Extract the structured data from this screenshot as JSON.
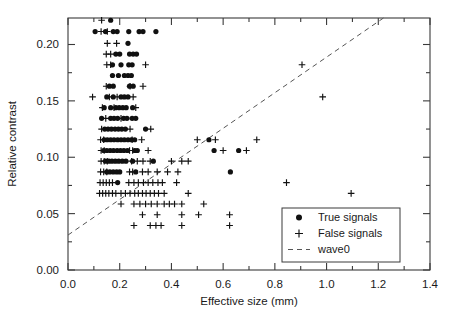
{
  "chart_data": {
    "type": "scatter",
    "title": "",
    "xlabel": "Effective size (mm)",
    "ylabel": "Relative contrast",
    "xlim": [
      0.0,
      1.4
    ],
    "ylim": [
      0.0,
      0.2235
    ],
    "grid": false,
    "legend_position": "lower-right",
    "xticks": [
      0.0,
      0.2,
      0.4,
      0.6,
      0.8,
      1.0,
      1.2,
      1.4
    ],
    "xticklabels": [
      "0.0",
      "0.2",
      "0.4",
      "0.6",
      "0.8",
      "1.0",
      "1.2",
      "1.4"
    ],
    "xminorticks": [
      0.1,
      0.3,
      0.5,
      0.7,
      0.9,
      1.1,
      1.3
    ],
    "yticks": [
      0.0,
      0.05,
      0.1,
      0.15,
      0.2
    ],
    "yticklabels": [
      "0.00",
      "0.05",
      "0.10",
      "0.15",
      "0.20"
    ],
    "yminorticks": [
      0.025,
      0.075,
      0.125,
      0.175
    ],
    "series": [
      {
        "name": "True signals",
        "marker": "filled-circle",
        "color": "#111111",
        "points": [
          [
            0.165,
            0.2215
          ],
          [
            0.105,
            0.2115
          ],
          [
            0.145,
            0.2115
          ],
          [
            0.175,
            0.2115
          ],
          [
            0.19,
            0.2115
          ],
          [
            0.235,
            0.2115
          ],
          [
            0.275,
            0.2115
          ],
          [
            0.29,
            0.2115
          ],
          [
            0.34,
            0.2115
          ],
          [
            0.232,
            0.201
          ],
          [
            0.185,
            0.1915
          ],
          [
            0.2,
            0.1915
          ],
          [
            0.238,
            0.1915
          ],
          [
            0.252,
            0.1915
          ],
          [
            0.265,
            0.1915
          ],
          [
            0.172,
            0.182
          ],
          [
            0.205,
            0.182
          ],
          [
            0.235,
            0.182
          ],
          [
            0.248,
            0.182
          ],
          [
            0.172,
            0.1725
          ],
          [
            0.195,
            0.1725
          ],
          [
            0.218,
            0.1725
          ],
          [
            0.232,
            0.1725
          ],
          [
            0.245,
            0.1725
          ],
          [
            0.16,
            0.163
          ],
          [
            0.175,
            0.163
          ],
          [
            0.238,
            0.163
          ],
          [
            0.252,
            0.163
          ],
          [
            0.15,
            0.1535
          ],
          [
            0.175,
            0.1535
          ],
          [
            0.205,
            0.1535
          ],
          [
            0.218,
            0.1535
          ],
          [
            0.232,
            0.1535
          ],
          [
            0.14,
            0.144
          ],
          [
            0.165,
            0.144
          ],
          [
            0.185,
            0.144
          ],
          [
            0.198,
            0.144
          ],
          [
            0.212,
            0.144
          ],
          [
            0.225,
            0.144
          ],
          [
            0.25,
            0.144
          ],
          [
            0.13,
            0.1345
          ],
          [
            0.165,
            0.1345
          ],
          [
            0.178,
            0.1345
          ],
          [
            0.192,
            0.1345
          ],
          [
            0.215,
            0.1345
          ],
          [
            0.228,
            0.1345
          ],
          [
            0.248,
            0.1345
          ],
          [
            0.262,
            0.1345
          ],
          [
            0.142,
            0.125
          ],
          [
            0.155,
            0.125
          ],
          [
            0.168,
            0.125
          ],
          [
            0.182,
            0.125
          ],
          [
            0.195,
            0.125
          ],
          [
            0.208,
            0.125
          ],
          [
            0.222,
            0.125
          ],
          [
            0.3,
            0.125
          ],
          [
            0.14,
            0.1155
          ],
          [
            0.152,
            0.1155
          ],
          [
            0.165,
            0.1155
          ],
          [
            0.178,
            0.1155
          ],
          [
            0.192,
            0.1155
          ],
          [
            0.205,
            0.1155
          ],
          [
            0.218,
            0.1155
          ],
          [
            0.232,
            0.1155
          ],
          [
            0.245,
            0.1155
          ],
          [
            0.258,
            0.1155
          ],
          [
            0.545,
            0.1155
          ],
          [
            0.138,
            0.106
          ],
          [
            0.15,
            0.106
          ],
          [
            0.163,
            0.106
          ],
          [
            0.176,
            0.106
          ],
          [
            0.19,
            0.106
          ],
          [
            0.203,
            0.106
          ],
          [
            0.216,
            0.106
          ],
          [
            0.23,
            0.106
          ],
          [
            0.258,
            0.106
          ],
          [
            0.268,
            0.106
          ],
          [
            0.565,
            0.106
          ],
          [
            0.66,
            0.106
          ],
          [
            0.145,
            0.0965
          ],
          [
            0.158,
            0.0965
          ],
          [
            0.17,
            0.0965
          ],
          [
            0.183,
            0.0965
          ],
          [
            0.196,
            0.0965
          ],
          [
            0.21,
            0.0965
          ],
          [
            0.224,
            0.0965
          ],
          [
            0.25,
            0.0965
          ],
          [
            0.33,
            0.0965
          ],
          [
            0.15,
            0.087
          ],
          [
            0.162,
            0.087
          ],
          [
            0.175,
            0.087
          ],
          [
            0.188,
            0.087
          ],
          [
            0.2,
            0.087
          ],
          [
            0.262,
            0.087
          ],
          [
            0.628,
            0.087
          ],
          [
            0.192,
            0.0775
          ]
        ]
      },
      {
        "name": "False signals",
        "marker": "plus",
        "color": "#111111",
        "points": [
          [
            0.13,
            0.2215
          ],
          [
            0.128,
            0.2115
          ],
          [
            0.152,
            0.2115
          ],
          [
            0.152,
            0.201
          ],
          [
            0.188,
            0.201
          ],
          [
            0.148,
            0.1915
          ],
          [
            0.165,
            0.1915
          ],
          [
            0.15,
            0.182
          ],
          [
            0.165,
            0.182
          ],
          [
            0.3,
            0.182
          ],
          [
            0.148,
            0.163
          ],
          [
            0.24,
            0.163
          ],
          [
            0.29,
            0.163
          ],
          [
            0.095,
            0.1535
          ],
          [
            0.16,
            0.1535
          ],
          [
            0.19,
            0.1535
          ],
          [
            0.252,
            0.1535
          ],
          [
            0.133,
            0.144
          ],
          [
            0.178,
            0.144
          ],
          [
            0.262,
            0.144
          ],
          [
            0.146,
            0.1345
          ],
          [
            0.205,
            0.1345
          ],
          [
            0.13,
            0.125
          ],
          [
            0.24,
            0.125
          ],
          [
            0.32,
            0.125
          ],
          [
            0.126,
            0.1155
          ],
          [
            0.138,
            0.1155
          ],
          [
            0.248,
            0.1155
          ],
          [
            0.285,
            0.1155
          ],
          [
            0.5,
            0.1155
          ],
          [
            0.57,
            0.1155
          ],
          [
            0.128,
            0.106
          ],
          [
            0.14,
            0.106
          ],
          [
            0.238,
            0.106
          ],
          [
            0.25,
            0.106
          ],
          [
            0.31,
            0.106
          ],
          [
            0.6,
            0.106
          ],
          [
            0.69,
            0.106
          ],
          [
            0.128,
            0.0965
          ],
          [
            0.14,
            0.0965
          ],
          [
            0.152,
            0.0965
          ],
          [
            0.246,
            0.0965
          ],
          [
            0.268,
            0.0965
          ],
          [
            0.29,
            0.0965
          ],
          [
            0.318,
            0.0965
          ],
          [
            0.4,
            0.0965
          ],
          [
            0.44,
            0.0965
          ],
          [
            0.465,
            0.0965
          ],
          [
            0.126,
            0.087
          ],
          [
            0.138,
            0.087
          ],
          [
            0.15,
            0.087
          ],
          [
            0.238,
            0.087
          ],
          [
            0.25,
            0.087
          ],
          [
            0.288,
            0.087
          ],
          [
            0.31,
            0.087
          ],
          [
            0.345,
            0.087
          ],
          [
            0.385,
            0.087
          ],
          [
            0.425,
            0.087
          ],
          [
            0.124,
            0.0775
          ],
          [
            0.136,
            0.0775
          ],
          [
            0.148,
            0.0775
          ],
          [
            0.16,
            0.0775
          ],
          [
            0.172,
            0.0775
          ],
          [
            0.235,
            0.0775
          ],
          [
            0.255,
            0.0775
          ],
          [
            0.272,
            0.0775
          ],
          [
            0.292,
            0.0775
          ],
          [
            0.31,
            0.0775
          ],
          [
            0.328,
            0.0775
          ],
          [
            0.348,
            0.0775
          ],
          [
            0.365,
            0.0775
          ],
          [
            0.42,
            0.0775
          ],
          [
            0.122,
            0.068
          ],
          [
            0.134,
            0.068
          ],
          [
            0.146,
            0.068
          ],
          [
            0.158,
            0.068
          ],
          [
            0.172,
            0.068
          ],
          [
            0.185,
            0.068
          ],
          [
            0.205,
            0.068
          ],
          [
            0.222,
            0.068
          ],
          [
            0.24,
            0.068
          ],
          [
            0.258,
            0.068
          ],
          [
            0.272,
            0.068
          ],
          [
            0.288,
            0.068
          ],
          [
            0.302,
            0.068
          ],
          [
            0.318,
            0.068
          ],
          [
            0.334,
            0.068
          ],
          [
            0.35,
            0.068
          ],
          [
            0.372,
            0.068
          ],
          [
            0.465,
            0.068
          ],
          [
            0.205,
            0.0585
          ],
          [
            0.255,
            0.0585
          ],
          [
            0.278,
            0.0585
          ],
          [
            0.3,
            0.0585
          ],
          [
            0.322,
            0.0585
          ],
          [
            0.345,
            0.0585
          ],
          [
            0.372,
            0.0585
          ],
          [
            0.392,
            0.0585
          ],
          [
            0.412,
            0.0585
          ],
          [
            0.44,
            0.0585
          ],
          [
            0.525,
            0.0585
          ],
          [
            0.288,
            0.049
          ],
          [
            0.345,
            0.049
          ],
          [
            0.44,
            0.049
          ],
          [
            0.505,
            0.049
          ],
          [
            0.625,
            0.049
          ],
          [
            0.255,
            0.0395
          ],
          [
            0.318,
            0.0395
          ],
          [
            0.34,
            0.0395
          ],
          [
            0.36,
            0.0395
          ],
          [
            0.44,
            0.0395
          ],
          [
            0.625,
            0.0395
          ],
          [
            0.73,
            0.1155
          ],
          [
            0.845,
            0.0775
          ],
          [
            0.985,
            0.1535
          ],
          [
            1.095,
            0.068
          ],
          [
            0.93,
            0.049
          ],
          [
            1.21,
            0.049
          ],
          [
            0.905,
            0.182
          ]
        ]
      }
    ],
    "reference_line": {
      "name": "wave0",
      "style": "dashed",
      "color": "#555555",
      "x0": 0.0,
      "y0": 0.031,
      "x1": 1.22,
      "y1": 0.2235
    },
    "legend_entries": [
      {
        "label": "True signals",
        "marker": "filled-circle"
      },
      {
        "label": "False signals",
        "marker": "plus"
      },
      {
        "label": "wave0",
        "marker": "dashed-line"
      }
    ]
  }
}
